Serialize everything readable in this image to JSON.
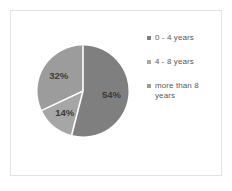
{
  "card": {
    "border_color": "#e3e3e3",
    "background": "#ffffff"
  },
  "chart_data": {
    "type": "pie",
    "title": "",
    "subtitle": "",
    "xlabel": "",
    "ylabel": "",
    "legend_position": "right",
    "grid": false,
    "start_angle_deg": 0,
    "direction": "clockwise",
    "separator_color": "#ffffff",
    "categories": [
      "0 - 4 years",
      "4 - 8 years",
      "more than 8 years"
    ],
    "values": [
      54,
      14,
      32
    ],
    "value_unit": "%",
    "data_labels": [
      "54%",
      "14%",
      "32%"
    ],
    "colors": [
      "#7f7f7f",
      "#a6a6a6",
      "#9c9c9c"
    ],
    "slices": [
      {
        "label": "0 - 4 years",
        "value": 54,
        "data_label": "54%",
        "color": "#7f7f7f"
      },
      {
        "label": "4 - 8 years",
        "value": 14,
        "data_label": "14%",
        "color": "#a6a6a6"
      },
      {
        "label": "more than 8 years",
        "value": 32,
        "data_label": "32%",
        "color": "#9c9c9c"
      }
    ]
  },
  "legend": {
    "items": [
      {
        "label": "0 - 4 years",
        "marker_color": "#7f7f7f",
        "marker_icon": "square-marker-icon"
      },
      {
        "label": "4 - 8 years",
        "marker_color": "#a6a6a6",
        "marker_icon": "square-marker-icon"
      },
      {
        "label": "more than 8 years",
        "marker_color": "#9c9c9c",
        "marker_icon": "square-marker-icon"
      }
    ]
  }
}
